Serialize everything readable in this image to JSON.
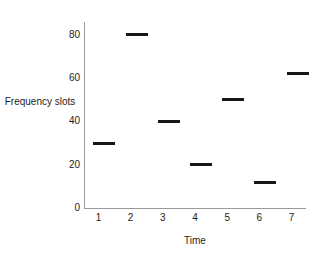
{
  "chart_data": {
    "type": "scatter",
    "title": "",
    "xlabel": "Time",
    "ylabel": "Frequency slots",
    "categories": [
      "1",
      "2",
      "3",
      "4",
      "5",
      "6",
      "7"
    ],
    "x": [
      1,
      2,
      3,
      4,
      5,
      6,
      7
    ],
    "values": [
      30,
      80,
      40,
      20,
      50,
      12,
      62
    ],
    "series": [
      {
        "name": "Frequency slots",
        "values": [
          30,
          80,
          40,
          20,
          50,
          12,
          62
        ]
      }
    ],
    "xlim": [
      0.55,
      7.45
    ],
    "ylim": [
      0,
      86
    ],
    "ytick_labels": [
      "0",
      "20",
      "40",
      "60",
      "80"
    ],
    "ytick_values": [
      0,
      20,
      40,
      60,
      80
    ],
    "xtick_labels": [
      "1",
      "2",
      "3",
      "4",
      "5",
      "6",
      "7"
    ],
    "grid": false,
    "legend": false,
    "marker_style": "horizontal-dash",
    "marker_color": "#171717",
    "axis_color": "#9a9a9a",
    "background_color": "#ffffff"
  }
}
